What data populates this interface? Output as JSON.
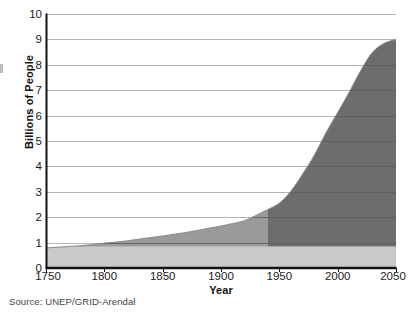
{
  "chart_data": {
    "type": "area",
    "title": "",
    "subtitle": "",
    "xlabel": "Year",
    "ylabel": "Billions of People",
    "xlim": [
      1750,
      2050
    ],
    "ylim": [
      0,
      10
    ],
    "xticks": [
      1750,
      1800,
      1850,
      1900,
      1950,
      2000,
      2050
    ],
    "yticks": [
      0,
      1,
      2,
      3,
      4,
      5,
      6,
      7,
      8,
      9,
      10
    ],
    "grid": "horizontal",
    "legend": "none",
    "series": [
      {
        "name": "World population",
        "x": [
          1750,
          1760,
          1770,
          1780,
          1790,
          1800,
          1810,
          1820,
          1830,
          1840,
          1850,
          1860,
          1870,
          1880,
          1890,
          1900,
          1910,
          1920,
          1930,
          1940,
          1950,
          1960,
          1970,
          1980,
          1990,
          2000,
          2010,
          2020,
          2030,
          2040,
          2050
        ],
        "values": [
          0.79,
          0.82,
          0.85,
          0.88,
          0.92,
          0.98,
          1.02,
          1.07,
          1.14,
          1.2,
          1.26,
          1.33,
          1.4,
          1.48,
          1.57,
          1.65,
          1.75,
          1.86,
          2.07,
          2.3,
          2.55,
          3.03,
          3.7,
          4.44,
          5.32,
          6.12,
          6.93,
          7.79,
          8.5,
          8.85,
          9.0
        ]
      }
    ],
    "bands": [
      {
        "name": "lower-band",
        "color": "#c9c9c9",
        "range": [
          0,
          0.85
        ]
      },
      {
        "name": "mid-band",
        "color": "#9b9b9b",
        "range": [
          0.85,
          9.0
        ]
      },
      {
        "name": "upper-band",
        "color": "#6e6e6e",
        "note": "darker shading in upper right above ~2 billion"
      }
    ],
    "colors": {
      "fill_light": "#c9c9c9",
      "fill_mid": "#9b9b9b",
      "fill_dark": "#6e6e6e",
      "gridline": "#b5b5b5",
      "gridline_over_fill": "#5f5f5f",
      "axis": "#1a1a1a",
      "text": "#1a1a1a",
      "source_text": "#444444",
      "background": "#ffffff"
    }
  },
  "axes": {
    "y_tick_labels": [
      "10",
      "9",
      "8",
      "7",
      "6",
      "5",
      "4",
      "3",
      "2",
      "1",
      "0"
    ],
    "x_tick_labels": [
      "1750",
      "1800",
      "1850",
      "1900",
      "1950",
      "2000",
      "2050"
    ],
    "y_axis_title": "Billions of People",
    "x_axis_title": "Year"
  },
  "footer": {
    "source": "Source:  UNEP/GRID-Arendal"
  }
}
